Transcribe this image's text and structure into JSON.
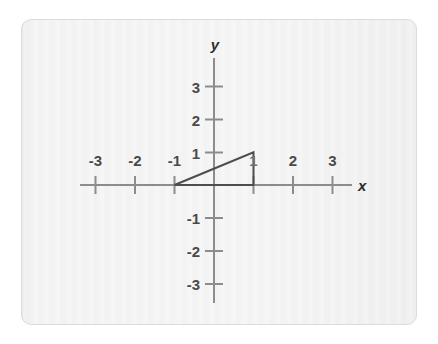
{
  "card": {
    "background_color": "#f2f2f2",
    "border_color": "#dcdcdc"
  },
  "axes": {
    "x_axis_label": "x",
    "y_axis_label": "y",
    "axis_color": "#8c8c8c",
    "tick_color": "#8c8c8c",
    "label_color": "#4a4a4a"
  },
  "chart_data": {
    "type": "scatter",
    "title": "",
    "subtitle": "",
    "xlabel": "x",
    "ylabel": "y",
    "xlim": [
      -4,
      4.2
    ],
    "ylim": [
      -3.9,
      3.85
    ],
    "grid": false,
    "legend": null,
    "x_tick_values": [
      -3,
      -2,
      -1,
      1,
      2,
      3
    ],
    "x_tick_labels": [
      "-3",
      "-2",
      "-1",
      "1",
      "2",
      "3"
    ],
    "y_tick_values": [
      3,
      2,
      1,
      -1,
      -2,
      -3
    ],
    "y_tick_labels": [
      "3",
      "2",
      "1",
      "-1",
      "-2",
      "-3"
    ],
    "x_tick_label_hidden": [
      "1"
    ],
    "annotations": [
      "x-axis tick label '1' is overlapped by the triangle's vertical leg"
    ],
    "shapes": [
      {
        "name": "right-triangle",
        "kind": "polygon",
        "closed": true,
        "filled": false,
        "stroke_color": "#4d4d4d",
        "stroke_width": 2,
        "vertices": [
          {
            "x": -1,
            "y": 0
          },
          {
            "x": 1,
            "y": 0
          },
          {
            "x": 1,
            "y": 1
          }
        ],
        "edges": [
          {
            "from": [
              -1,
              0
            ],
            "to": [
              1,
              0
            ],
            "role": "horizontal-leg",
            "length": 2
          },
          {
            "from": [
              1,
              0
            ],
            "to": [
              1,
              1
            ],
            "role": "vertical-leg",
            "length": 1
          },
          {
            "from": [
              1,
              1
            ],
            "to": [
              -1,
              0
            ],
            "role": "hypotenuse",
            "slope": 0.5
          }
        ]
      }
    ],
    "series": [
      {
        "name": "triangle-vertices",
        "x": [
          -1,
          1,
          1
        ],
        "y": [
          0,
          0,
          1
        ]
      }
    ]
  }
}
